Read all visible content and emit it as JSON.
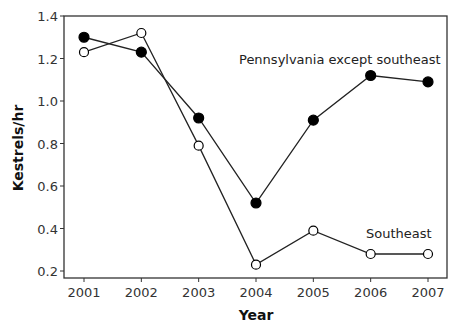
{
  "chart_data": {
    "type": "line",
    "title": "American Kestrel",
    "xlabel": "Year",
    "ylabel": "Kestrels/hr",
    "x": [
      2001,
      2002,
      2003,
      2004,
      2005,
      2006,
      2007
    ],
    "x_tick_labels": [
      "2001",
      "2002",
      "2003",
      "2004",
      "2005",
      "2006",
      "2007"
    ],
    "y_ticks": [
      0.2,
      0.4,
      0.6,
      0.8,
      1.0,
      1.2,
      1.4
    ],
    "y_tick_labels": [
      "0.2",
      "0.4",
      "0.6",
      "0.8",
      "1.0",
      "1.2",
      "1.4"
    ],
    "ylim": [
      0.2,
      1.4
    ],
    "grid": false,
    "legend": "none (inline series labels)",
    "series": [
      {
        "name": "Pennsylvania except southeast",
        "marker": "filled-circle",
        "values": [
          1.3,
          1.23,
          0.92,
          0.52,
          0.91,
          1.12,
          1.09
        ]
      },
      {
        "name": "Southeast",
        "marker": "open-circle",
        "values": [
          1.23,
          1.32,
          0.79,
          0.23,
          0.39,
          0.28,
          0.28
        ]
      }
    ],
    "annotations": [
      {
        "text": "Pennsylvania except southeast",
        "series": 0
      },
      {
        "text": "Southeast",
        "series": 1
      }
    ]
  },
  "colors": {
    "line": "#222222",
    "marker_fill": "#000000",
    "open_marker_fill": "#ffffff",
    "axis": "#333333"
  }
}
